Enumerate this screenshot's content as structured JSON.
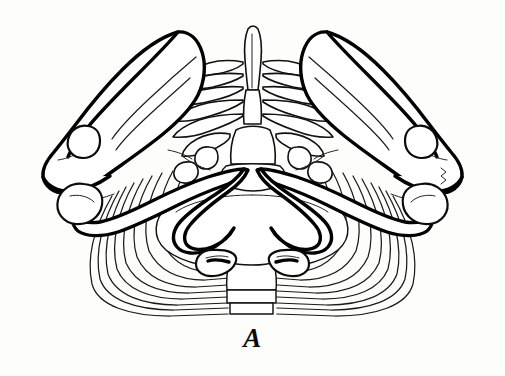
{
  "figure": {
    "label": "A",
    "caption_letter": "A",
    "background_color": "#fdfdfc",
    "line_color": "#000000",
    "fill_color": "#ffffff",
    "width": 505,
    "height": 376
  },
  "structures": {
    "left_scapula": "left-scapula",
    "right_scapula": "right-scapula",
    "left_clavicle": "left-clavicle",
    "right_clavicle": "right-clavicle",
    "left_acromion": "left-acromion",
    "right_acromion": "right-acromion",
    "vertebral_column": "vertebral-column",
    "spinous_process": "spinous-process",
    "sternum": "sternum",
    "rib_cage_left": "left-rib-cage",
    "rib_cage_right": "right-rib-cage",
    "thoracic_inlet": "thoracic-inlet"
  }
}
